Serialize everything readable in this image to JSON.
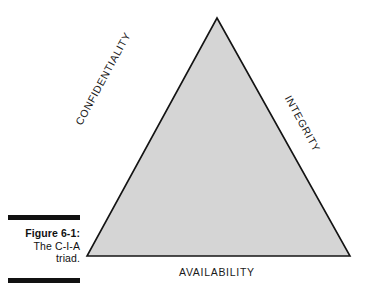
{
  "figure": {
    "caption_label": "Figure 6-1:",
    "caption_description_line1": "The C-I-A",
    "caption_description_line2": "triad."
  },
  "diagram": {
    "type": "triangle",
    "title": "The C-I-A triad",
    "fill_color": "#d5d5d5",
    "stroke_color": "#141414",
    "rule_color": "#111111",
    "labels": {
      "left_edge": "CONFIDENTIALITY",
      "right_edge": "INTEGRITY",
      "bottom_edge": "AVAILABILITY"
    },
    "vertices": {
      "apex": "217,18",
      "bottom_left": "87,256",
      "bottom_right": "350,256"
    }
  }
}
